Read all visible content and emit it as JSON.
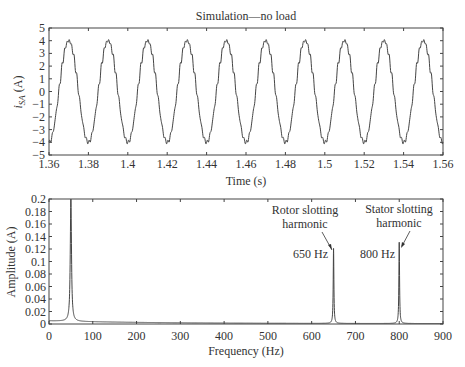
{
  "chart_data": [
    {
      "type": "line",
      "title": "Simulation—no load",
      "xlabel": "Time (s)",
      "ylabel": "i_SA (A)",
      "ylabel_main": "i",
      "ylabel_sub": "SA",
      "ylabel_unit": " (A)",
      "xlim": [
        1.36,
        1.56
      ],
      "ylim": [
        -5,
        5
      ],
      "xticks": [
        "1.36",
        "1.38",
        "1.4",
        "1.42",
        "1.44",
        "1.46",
        "1.48",
        "1.5",
        "1.52",
        "1.54",
        "1.56"
      ],
      "yticks": [
        "5",
        "4",
        "3",
        "2",
        "1",
        "0",
        "−1",
        "−2",
        "−3",
        "−4",
        "−5"
      ],
      "grid": false,
      "series": [
        {
          "name": "stator current phase A",
          "description": "50 Hz sinusoid, amplitude ~4 A, with small high-frequency slot ripple",
          "frequency_hz": 50,
          "amplitude": 4.0,
          "peak_times": [
            1.37,
            1.39,
            1.41,
            1.43,
            1.45,
            1.47,
            1.49,
            1.51,
            1.53,
            1.55
          ],
          "trough_times": [
            1.36,
            1.38,
            1.4,
            1.42,
            1.44,
            1.46,
            1.48,
            1.5,
            1.52,
            1.54,
            1.56
          ]
        }
      ]
    },
    {
      "type": "line",
      "title": "",
      "xlabel": "Frequency (Hz)",
      "ylabel": "Amplitude (A)",
      "xlim": [
        0,
        900
      ],
      "ylim": [
        0,
        0.2
      ],
      "xticks": [
        "0",
        "100",
        "200",
        "300",
        "400",
        "500",
        "600",
        "700",
        "800",
        "900"
      ],
      "yticks": [
        "0.2",
        "0.18",
        "0.16",
        "0.14",
        "0.12",
        "0.1",
        "0.08",
        "0.06",
        "0.04",
        "0.02",
        "0"
      ],
      "grid": false,
      "series": [
        {
          "name": "current spectrum",
          "x": [
            0,
            20,
            40,
            48,
            50,
            52,
            60,
            100,
            200,
            300,
            600,
            645,
            650,
            655,
            700,
            790,
            795,
            800,
            805,
            900
          ],
          "y": [
            0.005,
            0.006,
            0.015,
            0.06,
            0.2,
            0.06,
            0.015,
            0.004,
            0.002,
            0.001,
            0.001,
            0.006,
            0.12,
            0.006,
            0.001,
            0.002,
            0.006,
            0.13,
            0.006,
            0.001
          ]
        }
      ],
      "annotations": [
        {
          "text_line1": "Rotor slotting",
          "text_line2": "harmonic",
          "freq_label": "650 Hz",
          "x": 650,
          "y": 0.12
        },
        {
          "text_line1": "Stator slotting",
          "text_line2": "harmonic",
          "freq_label": "800 Hz",
          "x": 800,
          "y": 0.13
        }
      ]
    }
  ]
}
